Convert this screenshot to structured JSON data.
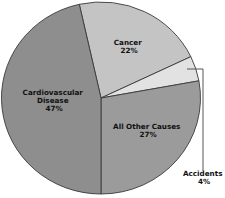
{
  "chart_data": {
    "type": "pie",
    "title": "",
    "slices": [
      {
        "label": "Cancer",
        "value": 22,
        "value_label": "22%",
        "color": "#c4c4c4",
        "start_deg": -12.6,
        "end_deg": 64.5
      },
      {
        "label": "Accidents",
        "value": 4,
        "value_label": "4%",
        "color": "#e2e2e2",
        "start_deg": 64.5,
        "end_deg": 79.7
      },
      {
        "label": "All Other Causes",
        "value": 27,
        "value_label": "27%",
        "color": "#9b9b9b",
        "start_deg": 79.7,
        "end_deg": 180
      },
      {
        "label": "Cardiovascular Disease",
        "value": 47,
        "value_label": "47%",
        "color": "#8e8e8e",
        "start_deg": 180,
        "end_deg": 347.4
      }
    ],
    "legend": "none (direct labels)",
    "annotations": [
      {
        "target": "Accidents",
        "type": "leader line to external label"
      }
    ]
  },
  "labels": {
    "cancer": {
      "line1": "Cancer",
      "line2": "22%"
    },
    "cardio": {
      "line1": "Cardiovascular",
      "line2": "Disease",
      "line3": "47%"
    },
    "other": {
      "line1": "All Other Causes",
      "line2": "27%"
    },
    "accidents": {
      "line1": "Accidents",
      "line2": "4%"
    }
  }
}
